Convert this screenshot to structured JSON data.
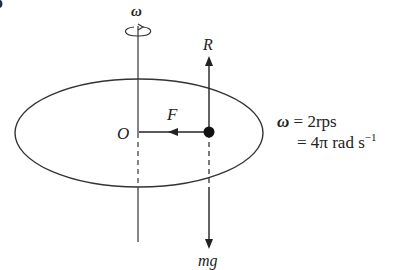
{
  "diagram": {
    "corner_mark": "b",
    "axis_label": "ω",
    "normal_force_label": "R",
    "centripetal_force_label": "F",
    "center_label": "O",
    "weight_label": "mg",
    "omega_symbol": "ω",
    "omega_value_line1": " = 2rps",
    "omega_value_line2": "= 4π rad s",
    "omega_unit_exponent": "−1"
  },
  "colors": {
    "stroke": "#2a2a2a",
    "background": "#ffffff"
  }
}
